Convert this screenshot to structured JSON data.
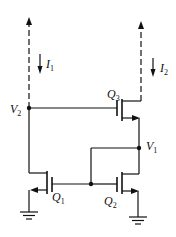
{
  "diagram": {
    "type": "circuit",
    "title": "",
    "labels": {
      "I1": {
        "main": "I",
        "sub": "1"
      },
      "I2": {
        "main": "I",
        "sub": "2"
      },
      "V1": {
        "main": "V",
        "sub": "1"
      },
      "V2": {
        "main": "V",
        "sub": "2"
      },
      "Q1": {
        "main": "Q",
        "sub": "1"
      },
      "Q2": {
        "main": "Q",
        "sub": "2"
      },
      "Q3": {
        "main": "Q",
        "sub": "3"
      }
    },
    "components": [
      {
        "id": "Q1",
        "kind": "nmos"
      },
      {
        "id": "Q2",
        "kind": "nmos"
      },
      {
        "id": "Q3",
        "kind": "nmos"
      },
      {
        "id": "GND1",
        "kind": "ground"
      },
      {
        "id": "GND2",
        "kind": "ground"
      }
    ],
    "nodes": [
      "V1",
      "V2"
    ],
    "currents": [
      "I1",
      "I2"
    ],
    "colors": {
      "stroke": "#111111",
      "background": "#ffffff"
    }
  }
}
